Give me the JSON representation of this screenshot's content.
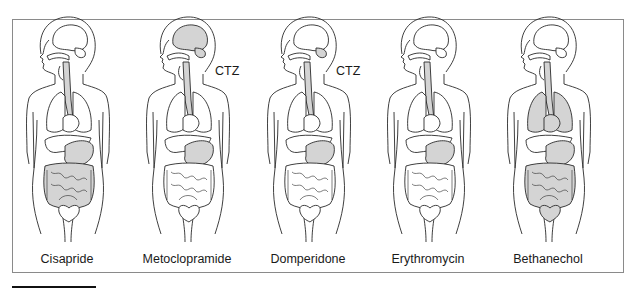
{
  "figure": {
    "panels": [
      {
        "label": "Cisapride",
        "center_x": 67,
        "ctz": "",
        "shaded": [
          "esophagus",
          "stomach",
          "intestines"
        ]
      },
      {
        "label": "Metoclopramide",
        "center_x": 187,
        "ctz": "CTZ",
        "shaded": [
          "brain",
          "esophagus",
          "stomach"
        ]
      },
      {
        "label": "Domperidone",
        "center_x": 308,
        "ctz": "CTZ",
        "shaded": [
          "brain-stem",
          "esophagus",
          "stomach"
        ]
      },
      {
        "label": "Erythromycin",
        "center_x": 428,
        "ctz": "",
        "shaded": [
          "esophagus",
          "stomach"
        ]
      },
      {
        "label": "Bethanechol",
        "center_x": 548,
        "ctz": "",
        "shaded": [
          "esophagus",
          "lungs",
          "stomach",
          "intestines",
          "bladder"
        ]
      }
    ],
    "colors": {
      "line": "#2a2a2a",
      "shade": "#d4d4d4",
      "frame": "#8a8a8a"
    }
  }
}
